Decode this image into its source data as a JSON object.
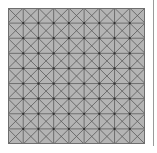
{
  "figure": {
    "type": "mesh-grid",
    "rows": 9,
    "cols": 9,
    "cell_pattern": "x-diagonals",
    "colors": {
      "fill": "#b4b4b4",
      "grid_line": "#6e6e6e",
      "diagonal_line": "#5a5a5a",
      "node": "#2e2e2e",
      "border_line": "#9a9a9a",
      "background": "#ffffff"
    }
  }
}
